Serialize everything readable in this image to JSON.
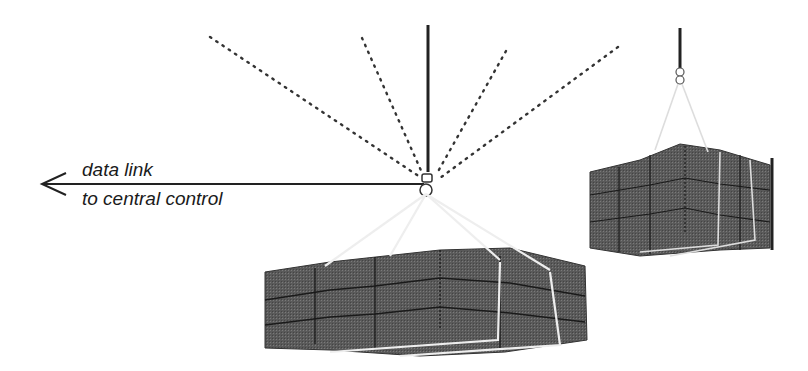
{
  "figure": {
    "type": "technical-illustration",
    "labels": {
      "line1": "data link",
      "line2": "to central control"
    },
    "colors": {
      "background": "#ffffff",
      "line": "#2a2a2a",
      "load_fill": "#5c5c5c",
      "load_grid": "#222222",
      "sling": "#e8e8e8",
      "signal_dots": "#333333"
    },
    "elements": [
      {
        "name": "arrow-data-link",
        "direction": "left"
      },
      {
        "name": "hook-main",
        "signal_rays": 4
      },
      {
        "name": "load-main",
        "rows": 3,
        "cols": 4
      },
      {
        "name": "load-secondary",
        "rows": 3,
        "cols": 3
      }
    ]
  }
}
